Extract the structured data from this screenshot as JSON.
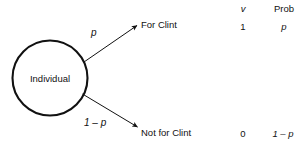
{
  "diagram": {
    "type": "probability-tree",
    "root_node": {
      "label": "Individual",
      "shape": "circle"
    },
    "branches": [
      {
        "id": "for-clint",
        "probability_label": "p",
        "outcome_label": "For Clint",
        "v": "1",
        "prob": "p"
      },
      {
        "id": "not-for-clint",
        "probability_label": "1 – p",
        "outcome_label": "Not for Clint",
        "v": "0",
        "prob": "1 – p"
      }
    ],
    "table": {
      "headers": {
        "v": "v",
        "prob": "Prob"
      }
    },
    "colors": {
      "stroke": "#111111",
      "text": "#111111",
      "background": "#ffffff"
    }
  }
}
